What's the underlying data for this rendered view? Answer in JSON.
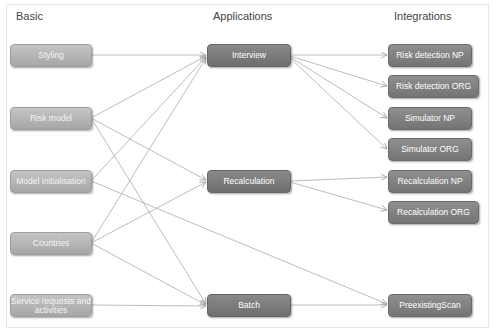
{
  "columns": {
    "basic": "Basic",
    "applications": "Applications",
    "integrations": "Integrations"
  },
  "nodes": {
    "styling": "Styling",
    "risk_model": "Risk model",
    "model_init": "Model initialisation",
    "countries": "Countries",
    "service_requests": "Service requests and activities",
    "interview": "Interview",
    "recalculation": "Recalculation",
    "batch": "Batch",
    "rd_np": "Risk detection NP",
    "rd_org": "Risk detection ORG",
    "sim_np": "Simulator NP",
    "sim_org": "Simulator ORG",
    "recalc_np": "Recalculation NP",
    "recalc_org": "Recalculation ORG",
    "preexisting": "PreexistingScan"
  },
  "edges": [
    [
      "styling",
      "interview"
    ],
    [
      "risk_model",
      "interview"
    ],
    [
      "risk_model",
      "recalculation"
    ],
    [
      "risk_model",
      "batch"
    ],
    [
      "model_init",
      "interview"
    ],
    [
      "model_init",
      "preexisting"
    ],
    [
      "countries",
      "interview"
    ],
    [
      "countries",
      "recalculation"
    ],
    [
      "countries",
      "batch"
    ],
    [
      "service_requests",
      "batch"
    ],
    [
      "interview",
      "rd_np"
    ],
    [
      "interview",
      "rd_org"
    ],
    [
      "interview",
      "sim_np"
    ],
    [
      "interview",
      "sim_org"
    ],
    [
      "recalculation",
      "recalc_np"
    ],
    [
      "recalculation",
      "recalc_org"
    ],
    [
      "batch",
      "preexisting"
    ]
  ],
  "colors": {
    "basic_fill": "#b4b4b4",
    "app_fill": "#7c7c7c",
    "integration_fill": "#818181",
    "edge": "#b0b0b0"
  }
}
